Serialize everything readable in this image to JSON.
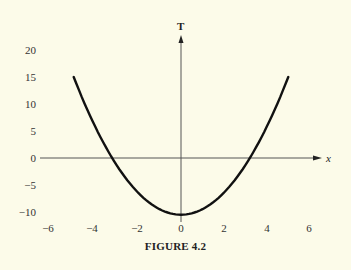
{
  "chart_data": {
    "type": "line",
    "title": "",
    "caption": "FIGURE 4.2",
    "xlabel": "x",
    "ylabel": "T",
    "xlim": [
      -6,
      6
    ],
    "ylim": [
      -10,
      20
    ],
    "xticks": [
      -6,
      -4,
      -2,
      0,
      2,
      4,
      6
    ],
    "yticks": [
      20,
      15,
      10,
      5,
      0,
      -5,
      -10
    ],
    "grid": false,
    "legend": null,
    "series": [
      {
        "name": "T(x)",
        "description": "upward-opening parabola, minimum near (0, -10.5), x-intercepts near ±3.2",
        "x": [
          -4.9,
          -4,
          -3.2,
          -2,
          -1,
          0,
          1,
          2,
          3.2,
          4,
          4.9
        ],
        "y": [
          15,
          6,
          0,
          -6.4,
          -9.5,
          -10.5,
          -9.5,
          -6.4,
          0,
          6,
          15
        ]
      }
    ]
  },
  "labels": {
    "y_axis": "T",
    "x_axis": "x",
    "caption": "FIGURE 4.2",
    "xticks": [
      "−6",
      "−4",
      "−2",
      "0",
      "2",
      "4",
      "6"
    ],
    "yticks": [
      "20",
      "15",
      "10",
      "5",
      "0",
      "−5",
      "−10"
    ]
  },
  "colors": {
    "background": "#fcfbe9",
    "curve": "#111111",
    "axis": "#444444"
  }
}
